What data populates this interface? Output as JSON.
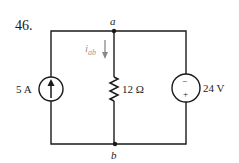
{
  "problem": {
    "number": "46."
  },
  "nodes": {
    "a": "a",
    "b": "b"
  },
  "current_label": {
    "main": "i",
    "sub": "ab"
  },
  "components": {
    "current_source": {
      "label": "5 A",
      "direction": "up"
    },
    "resistor": {
      "label": "12 Ω"
    },
    "voltage_source": {
      "label": "24 V",
      "top_sign": "−",
      "bottom_sign": "+"
    }
  },
  "colors": {
    "wire": "#1a1a1a",
    "arrow": "#888888"
  }
}
